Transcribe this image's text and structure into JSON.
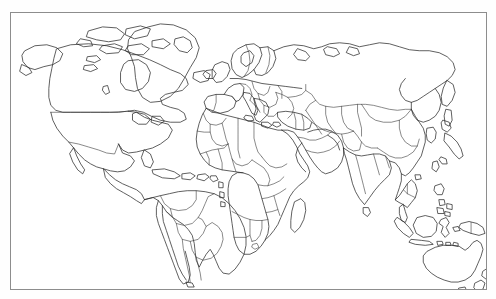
{
  "document": {
    "type": "image",
    "title": "Blank world political outline map",
    "background_color": "#ffffff",
    "line_color": "#2b2b2b",
    "frame_color": "#8d8d8d",
    "frame": {
      "x": 10,
      "y": 12,
      "width": 477,
      "height": 278
    },
    "has_labels": false,
    "watermark_text": "",
    "watermark_color": "#dadada"
  },
  "map": {
    "projection_note": "equirectangular-like world map",
    "regions": [
      {
        "name": "north-america",
        "label": "North America"
      },
      {
        "name": "greenland",
        "label": "Greenland"
      },
      {
        "name": "central-america",
        "label": "Central America"
      },
      {
        "name": "caribbean",
        "label": "Caribbean Islands"
      },
      {
        "name": "south-america",
        "label": "South America"
      },
      {
        "name": "europe",
        "label": "Europe"
      },
      {
        "name": "africa",
        "label": "Africa"
      },
      {
        "name": "middle-east",
        "label": "Middle East"
      },
      {
        "name": "russia-siberia",
        "label": "Russia and Siberia"
      },
      {
        "name": "central-asia",
        "label": "Central Asia"
      },
      {
        "name": "south-asia",
        "label": "South Asia"
      },
      {
        "name": "east-asia",
        "label": "East Asia"
      },
      {
        "name": "southeast-asia",
        "label": "Southeast Asia"
      },
      {
        "name": "japan",
        "label": "Japan"
      },
      {
        "name": "philippines",
        "label": "Philippines"
      },
      {
        "name": "indonesia",
        "label": "Indonesia"
      },
      {
        "name": "australia",
        "label": "Australia"
      },
      {
        "name": "new-zealand",
        "label": "New Zealand"
      },
      {
        "name": "madagascar",
        "label": "Madagascar"
      },
      {
        "name": "new-guinea",
        "label": "New Guinea"
      },
      {
        "name": "british-isles",
        "label": "British Isles"
      },
      {
        "name": "iceland",
        "label": "Iceland"
      },
      {
        "name": "sri-lanka",
        "label": "Sri Lanka"
      }
    ]
  }
}
